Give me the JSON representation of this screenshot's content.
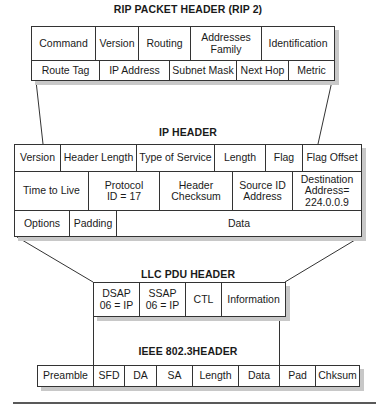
{
  "rip": {
    "title": "RIP PACKET HEADER (RIP 2)",
    "row1": [
      "Command",
      "Version",
      "Routing",
      "Addresses Family",
      "Identification"
    ],
    "row2": [
      "Route Tag",
      "IP Address",
      "Subnet Mask",
      "Next Hop",
      "Metric"
    ]
  },
  "ip": {
    "title": "IP HEADER",
    "row1": [
      "Version",
      "Header Length",
      "Type of Service",
      "Length",
      "Flag",
      "Flag Offset"
    ],
    "row2": [
      "Time to Live",
      "Protocol ID = 17",
      "Header Checksum",
      "Source ID Address",
      "Destination Address= 224.0.0.9"
    ],
    "row3": [
      "Options",
      "Padding",
      "Data"
    ]
  },
  "llc": {
    "title": "LLC PDU HEADER",
    "row1": [
      "DSAP 06 = IP",
      "SSAP 06 = IP",
      "CTL",
      "Information"
    ]
  },
  "ieee": {
    "title": "IEEE 802.3HEADER",
    "row1": [
      "Preamble",
      "SFD",
      "DA",
      "SA",
      "Length",
      "Data",
      "Pad",
      "Chksum"
    ]
  }
}
